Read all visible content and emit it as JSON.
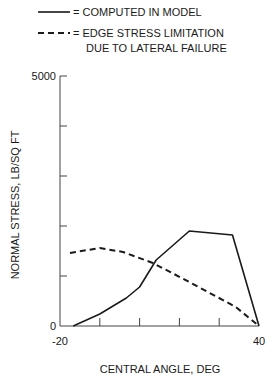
{
  "chart_data": {
    "type": "line",
    "title": "",
    "xlabel": "CENTRAL ANGLE, DEG",
    "ylabel": "NORMAL STRESS, LB/SQ FT",
    "xlim": [
      -20,
      40
    ],
    "ylim": [
      0,
      5000
    ],
    "x_tick_labels": [
      "-20",
      "40"
    ],
    "y_tick_labels": [
      "0",
      "5000"
    ],
    "x_minor_ticks": 5,
    "y_minor_ticks": 5,
    "grid": false,
    "legend": {
      "placement": "top",
      "entries": [
        {
          "style": "solid",
          "label": "= COMPUTED IN MODEL"
        },
        {
          "style": "dashed",
          "label_lines": [
            "= EDGE STRESS LIMITATION",
            "DUE TO LATERAL FAILURE"
          ]
        }
      ]
    },
    "series": [
      {
        "name": "COMPUTED IN MODEL",
        "style": "solid",
        "points": [
          [
            -16,
            0
          ],
          [
            -8,
            240
          ],
          [
            0,
            560
          ],
          [
            4,
            780
          ],
          [
            9,
            1320
          ],
          [
            19,
            1900
          ],
          [
            32,
            1820
          ],
          [
            40,
            0
          ]
        ]
      },
      {
        "name": "EDGE STRESS LIMITATION DUE TO LATERAL FAILURE",
        "style": "dashed",
        "points": [
          [
            -17,
            1460
          ],
          [
            -8,
            1560
          ],
          [
            -1,
            1480
          ],
          [
            8,
            1260
          ],
          [
            19,
            880
          ],
          [
            33,
            380
          ],
          [
            40,
            0
          ]
        ]
      }
    ]
  }
}
